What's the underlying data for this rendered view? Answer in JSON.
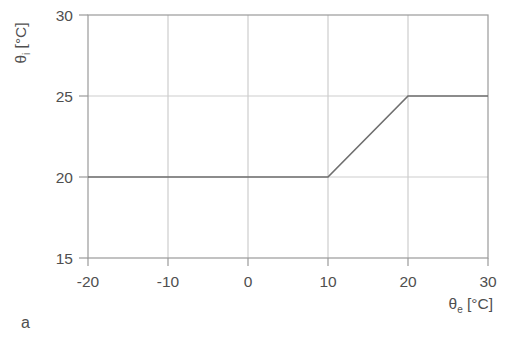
{
  "figure_label": "a",
  "chart_data": {
    "type": "line",
    "title": "",
    "xlabel": {
      "symbol": "θ",
      "subscript": "e",
      "unit": "[°C]"
    },
    "ylabel": {
      "symbol": "θ",
      "subscript": "i",
      "unit": "[°C]"
    },
    "xlim": [
      -20,
      30
    ],
    "ylim": [
      15,
      30
    ],
    "x_ticks": [
      -20,
      -10,
      0,
      10,
      20,
      30
    ],
    "x_tick_labels": [
      "-20",
      "-10",
      "0",
      "10",
      "20",
      "30"
    ],
    "y_ticks": [
      15,
      20,
      25,
      30
    ],
    "y_tick_labels": [
      "15",
      "20",
      "25",
      "30"
    ],
    "grid": true,
    "legend": "none",
    "series": [
      {
        "name": "setpoint-curve",
        "points": [
          [
            -20,
            20
          ],
          [
            10,
            20
          ],
          [
            20,
            25
          ],
          [
            30,
            25
          ]
        ]
      }
    ],
    "colors": {
      "grid": "#cdcdcd",
      "axis": "#9a9a9a",
      "line": "#6f6f6f",
      "label": "#4f4f4f",
      "background": "#ffffff"
    }
  }
}
